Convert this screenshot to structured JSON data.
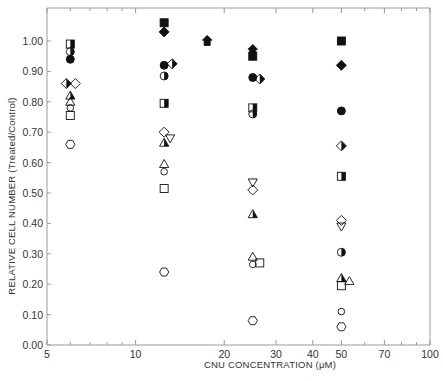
{
  "chart_data": {
    "type": "scatter",
    "title": "",
    "xlabel": "CNU CONCENTRATION (μM)",
    "ylabel": "RELATIVE CELL NUMBER (Treated/Control)",
    "xscale": "log",
    "xlim": [
      5,
      100
    ],
    "ylim": [
      0.0,
      1.1
    ],
    "grid": false,
    "legend": "none",
    "x_ticks": [
      5,
      10,
      20,
      30,
      40,
      50,
      70,
      100
    ],
    "x_tick_labels": [
      "5",
      "10",
      "20",
      "30",
      "40",
      "50",
      "70",
      "100"
    ],
    "x_minor_ticks": [
      6,
      7,
      8,
      9,
      60,
      80,
      90
    ],
    "y_ticks": [
      0.0,
      0.1,
      0.2,
      0.3,
      0.4,
      0.5,
      0.6,
      0.7,
      0.8,
      0.9,
      1.0
    ],
    "y_tick_labels": [
      "0.00",
      "0.10",
      "0.20",
      "0.30",
      "0.40",
      "0.50",
      "0.60",
      "0.70",
      "0.80",
      "0.90",
      "1.00"
    ],
    "points": [
      {
        "x": 6,
        "y": 0.99,
        "marker": "square-half-filled"
      },
      {
        "x": 6,
        "y": 0.965,
        "marker": "circle-half-filled"
      },
      {
        "x": 6,
        "y": 0.94,
        "marker": "circle-filled"
      },
      {
        "x": 6,
        "y": 0.86,
        "marker": "diamond-half-filled",
        "dx": -4
      },
      {
        "x": 6,
        "y": 0.86,
        "marker": "diamond-open",
        "dx": 5
      },
      {
        "x": 6,
        "y": 0.82,
        "marker": "triangle-half-filled"
      },
      {
        "x": 6,
        "y": 0.8,
        "marker": "triangle-open"
      },
      {
        "x": 6,
        "y": 0.78,
        "marker": "circle-open-small"
      },
      {
        "x": 6,
        "y": 0.755,
        "marker": "square-open"
      },
      {
        "x": 6,
        "y": 0.66,
        "marker": "hexagon-open"
      },
      {
        "x": 12.5,
        "y": 1.06,
        "marker": "square-filled"
      },
      {
        "x": 12.5,
        "y": 1.03,
        "marker": "diamond-filled"
      },
      {
        "x": 12.5,
        "y": 0.92,
        "marker": "circle-filled"
      },
      {
        "x": 12.5,
        "y": 0.925,
        "marker": "diamond-half-filled",
        "dx": 8
      },
      {
        "x": 12.5,
        "y": 0.885,
        "marker": "circle-half-filled"
      },
      {
        "x": 12.5,
        "y": 0.795,
        "marker": "square-half-filled"
      },
      {
        "x": 12.5,
        "y": 0.7,
        "marker": "diamond-open"
      },
      {
        "x": 12.5,
        "y": 0.68,
        "marker": "triangle-down-open",
        "dx": 6
      },
      {
        "x": 12.5,
        "y": 0.665,
        "marker": "triangle-half-filled"
      },
      {
        "x": 12.5,
        "y": 0.595,
        "marker": "triangle-open"
      },
      {
        "x": 12.5,
        "y": 0.57,
        "marker": "circle-open-small"
      },
      {
        "x": 12.5,
        "y": 0.515,
        "marker": "square-open"
      },
      {
        "x": 12.5,
        "y": 0.24,
        "marker": "hexagon-open"
      },
      {
        "x": 17.5,
        "y": 1.0,
        "marker": "arrow-up-filled"
      },
      {
        "x": 25,
        "y": 0.97,
        "marker": "arrow-up-filled"
      },
      {
        "x": 25,
        "y": 0.95,
        "marker": "square-filled"
      },
      {
        "x": 25,
        "y": 0.88,
        "marker": "circle-filled"
      },
      {
        "x": 25,
        "y": 0.875,
        "marker": "diamond-half-filled",
        "dx": 7
      },
      {
        "x": 25,
        "y": 0.78,
        "marker": "square-half-filled"
      },
      {
        "x": 25,
        "y": 0.76,
        "marker": "circle-half-filled"
      },
      {
        "x": 25,
        "y": 0.535,
        "marker": "triangle-down-open"
      },
      {
        "x": 25,
        "y": 0.51,
        "marker": "diamond-open"
      },
      {
        "x": 25,
        "y": 0.43,
        "marker": "triangle-half-filled"
      },
      {
        "x": 25,
        "y": 0.29,
        "marker": "triangle-open"
      },
      {
        "x": 25,
        "y": 0.265,
        "marker": "circle-open-small"
      },
      {
        "x": 25,
        "y": 0.27,
        "marker": "square-open",
        "dx": 7
      },
      {
        "x": 25,
        "y": 0.08,
        "marker": "hexagon-open"
      },
      {
        "x": 50,
        "y": 1.0,
        "marker": "square-filled"
      },
      {
        "x": 50,
        "y": 0.92,
        "marker": "diamond-filled"
      },
      {
        "x": 50,
        "y": 0.77,
        "marker": "circle-filled"
      },
      {
        "x": 50,
        "y": 0.655,
        "marker": "diamond-half-filled"
      },
      {
        "x": 50,
        "y": 0.555,
        "marker": "square-half-filled"
      },
      {
        "x": 50,
        "y": 0.41,
        "marker": "diamond-open"
      },
      {
        "x": 50,
        "y": 0.39,
        "marker": "triangle-down-open"
      },
      {
        "x": 50,
        "y": 0.305,
        "marker": "circle-half-filled"
      },
      {
        "x": 50,
        "y": 0.22,
        "marker": "triangle-half-filled"
      },
      {
        "x": 50,
        "y": 0.21,
        "marker": "triangle-open",
        "dx": 8
      },
      {
        "x": 50,
        "y": 0.195,
        "marker": "square-open"
      },
      {
        "x": 50,
        "y": 0.11,
        "marker": "circle-open-small"
      },
      {
        "x": 50,
        "y": 0.06,
        "marker": "hexagon-open"
      }
    ]
  },
  "colors": {
    "axis": "#9a9a9a",
    "marker": "#111111",
    "text": "#333333"
  }
}
